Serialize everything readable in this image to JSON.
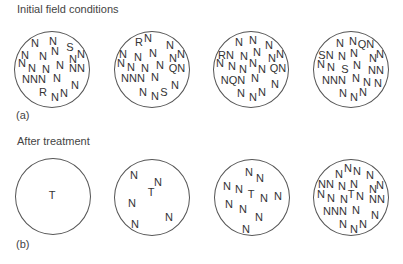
{
  "panel_a": {
    "title": "Initial field conditions",
    "label": "(a)",
    "circles": [
      {
        "cx": 52,
        "cy": 69,
        "letters": [
          {
            "t": "N",
            "x": 35,
            "y": 43
          },
          {
            "t": "N",
            "x": 53,
            "y": 41
          },
          {
            "t": "S",
            "x": 70,
            "y": 47
          },
          {
            "t": "N",
            "x": 25,
            "y": 55
          },
          {
            "t": "N",
            "x": 43,
            "y": 56
          },
          {
            "t": "N",
            "x": 55,
            "y": 51
          },
          {
            "t": "N",
            "x": 73,
            "y": 59
          },
          {
            "t": "N",
            "x": 81,
            "y": 54
          },
          {
            "t": "N",
            "x": 22,
            "y": 63
          },
          {
            "t": "N",
            "x": 32,
            "y": 68
          },
          {
            "t": "N",
            "x": 46,
            "y": 69
          },
          {
            "t": "N",
            "x": 60,
            "y": 65
          },
          {
            "t": "NN",
            "x": 77,
            "y": 68
          },
          {
            "t": "NNN",
            "x": 34,
            "y": 79
          },
          {
            "t": "N",
            "x": 57,
            "y": 78
          },
          {
            "t": "N",
            "x": 75,
            "y": 85
          },
          {
            "t": "R",
            "x": 43,
            "y": 92
          },
          {
            "t": "N",
            "x": 55,
            "y": 97
          },
          {
            "t": "N",
            "x": 64,
            "y": 93
          }
        ]
      },
      {
        "cx": 152,
        "cy": 69,
        "letters": [
          {
            "t": "R",
            "x": 139,
            "y": 42
          },
          {
            "t": "N",
            "x": 148,
            "y": 38
          },
          {
            "t": "N",
            "x": 170,
            "y": 45
          },
          {
            "t": "N",
            "x": 123,
            "y": 54
          },
          {
            "t": "N",
            "x": 138,
            "y": 57
          },
          {
            "t": "N",
            "x": 153,
            "y": 53
          },
          {
            "t": "N",
            "x": 173,
            "y": 58
          },
          {
            "t": "N",
            "x": 181,
            "y": 54
          },
          {
            "t": "N",
            "x": 121,
            "y": 63
          },
          {
            "t": "N",
            "x": 131,
            "y": 67
          },
          {
            "t": "N",
            "x": 145,
            "y": 68
          },
          {
            "t": "N",
            "x": 160,
            "y": 65
          },
          {
            "t": "QN",
            "x": 177,
            "y": 68
          },
          {
            "t": "NNN",
            "x": 133,
            "y": 78
          },
          {
            "t": "N",
            "x": 155,
            "y": 77
          },
          {
            "t": "N",
            "x": 175,
            "y": 85
          },
          {
            "t": "N",
            "x": 143,
            "y": 92
          },
          {
            "t": "N",
            "x": 155,
            "y": 96
          },
          {
            "t": "S",
            "x": 164,
            "y": 92
          }
        ]
      },
      {
        "cx": 251,
        "cy": 69,
        "letters": [
          {
            "t": "N",
            "x": 239,
            "y": 42
          },
          {
            "t": "N",
            "x": 253,
            "y": 40
          },
          {
            "t": "N",
            "x": 269,
            "y": 45
          },
          {
            "t": "RN",
            "x": 226,
            "y": 55
          },
          {
            "t": "N",
            "x": 244,
            "y": 56
          },
          {
            "t": "N",
            "x": 257,
            "y": 52
          },
          {
            "t": "N",
            "x": 272,
            "y": 58
          },
          {
            "t": "N",
            "x": 280,
            "y": 54
          },
          {
            "t": "N",
            "x": 220,
            "y": 63
          },
          {
            "t": "N",
            "x": 232,
            "y": 66
          },
          {
            "t": "N",
            "x": 243,
            "y": 69
          },
          {
            "t": "N",
            "x": 253,
            "y": 63
          },
          {
            "t": "N",
            "x": 262,
            "y": 69
          },
          {
            "t": "QN",
            "x": 278,
            "y": 68
          },
          {
            "t": "NQN",
            "x": 233,
            "y": 80
          },
          {
            "t": "N",
            "x": 255,
            "y": 78
          },
          {
            "t": "N",
            "x": 275,
            "y": 84
          },
          {
            "t": "N",
            "x": 241,
            "y": 93
          },
          {
            "t": "N",
            "x": 253,
            "y": 97
          },
          {
            "t": "N",
            "x": 262,
            "y": 92
          }
        ]
      },
      {
        "cx": 351,
        "cy": 69,
        "letters": [
          {
            "t": "N",
            "x": 340,
            "y": 43
          },
          {
            "t": "N",
            "x": 353,
            "y": 41
          },
          {
            "t": "QN",
            "x": 366,
            "y": 44
          },
          {
            "t": "SN",
            "x": 326,
            "y": 55
          },
          {
            "t": "N",
            "x": 342,
            "y": 56
          },
          {
            "t": "N",
            "x": 354,
            "y": 53
          },
          {
            "t": "N",
            "x": 373,
            "y": 58
          },
          {
            "t": "N",
            "x": 380,
            "y": 54
          },
          {
            "t": "N",
            "x": 321,
            "y": 64
          },
          {
            "t": "N",
            "x": 331,
            "y": 67
          },
          {
            "t": "S",
            "x": 345,
            "y": 69
          },
          {
            "t": "N",
            "x": 357,
            "y": 65
          },
          {
            "t": "NN",
            "x": 376,
            "y": 70
          },
          {
            "t": "NNN",
            "x": 334,
            "y": 80
          },
          {
            "t": "N",
            "x": 356,
            "y": 78
          },
          {
            "t": "N",
            "x": 367,
            "y": 82
          },
          {
            "t": "N",
            "x": 378,
            "y": 83
          },
          {
            "t": "N",
            "x": 343,
            "y": 93
          },
          {
            "t": "N",
            "x": 354,
            "y": 97
          },
          {
            "t": "N",
            "x": 363,
            "y": 92
          }
        ]
      }
    ]
  },
  "panel_b": {
    "title": "After treatment",
    "label": "(b)",
    "circles": [
      {
        "cx": 53,
        "cy": 196,
        "letters": [
          {
            "t": "T",
            "x": 52,
            "y": 195
          }
        ]
      },
      {
        "cx": 152,
        "cy": 197,
        "letters": [
          {
            "t": "N",
            "x": 134,
            "y": 175
          },
          {
            "t": "N",
            "x": 158,
            "y": 182
          },
          {
            "t": "T",
            "x": 151,
            "y": 192
          },
          {
            "t": "N",
            "x": 132,
            "y": 203
          },
          {
            "t": "N",
            "x": 169,
            "y": 217
          },
          {
            "t": "N",
            "x": 135,
            "y": 224
          }
        ]
      },
      {
        "cx": 252,
        "cy": 197,
        "letters": [
          {
            "t": "N",
            "x": 249,
            "y": 172
          },
          {
            "t": "N",
            "x": 260,
            "y": 178
          },
          {
            "t": "N",
            "x": 227,
            "y": 186
          },
          {
            "t": "N",
            "x": 239,
            "y": 189
          },
          {
            "t": "T",
            "x": 251,
            "y": 194
          },
          {
            "t": "N",
            "x": 264,
            "y": 198
          },
          {
            "t": "N",
            "x": 278,
            "y": 196
          },
          {
            "t": "N",
            "x": 229,
            "y": 204
          },
          {
            "t": "N",
            "x": 243,
            "y": 209
          },
          {
            "t": "N",
            "x": 259,
            "y": 217
          },
          {
            "t": "N",
            "x": 246,
            "y": 229
          }
        ]
      },
      {
        "cx": 351,
        "cy": 197,
        "letters": [
          {
            "t": "N",
            "x": 339,
            "y": 174
          },
          {
            "t": "N",
            "x": 348,
            "y": 168
          },
          {
            "t": "N",
            "x": 357,
            "y": 171
          },
          {
            "t": "N",
            "x": 370,
            "y": 175
          },
          {
            "t": "NN",
            "x": 326,
            "y": 184
          },
          {
            "t": "N",
            "x": 342,
            "y": 186
          },
          {
            "t": "N",
            "x": 354,
            "y": 184
          },
          {
            "t": "N",
            "x": 373,
            "y": 189
          },
          {
            "t": "N",
            "x": 380,
            "y": 185
          },
          {
            "t": "N",
            "x": 321,
            "y": 194
          },
          {
            "t": "N",
            "x": 331,
            "y": 198
          },
          {
            "t": "N",
            "x": 344,
            "y": 199
          },
          {
            "t": "T",
            "x": 351,
            "y": 194
          },
          {
            "t": "N",
            "x": 360,
            "y": 196
          },
          {
            "t": "NN",
            "x": 377,
            "y": 199
          },
          {
            "t": "NNN",
            "x": 335,
            "y": 211
          },
          {
            "t": "N",
            "x": 356,
            "y": 210
          },
          {
            "t": "N",
            "x": 375,
            "y": 215
          },
          {
            "t": "N",
            "x": 343,
            "y": 224
          },
          {
            "t": "N",
            "x": 354,
            "y": 229
          },
          {
            "t": "N",
            "x": 363,
            "y": 224
          }
        ]
      }
    ]
  }
}
